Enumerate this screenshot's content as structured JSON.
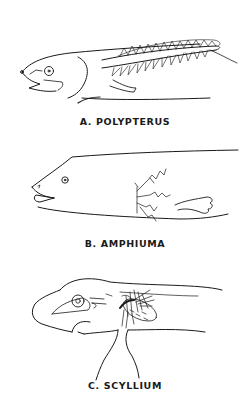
{
  "figure": {
    "panels": [
      {
        "id": "A",
        "caption": "A. POLYPTERUS"
      },
      {
        "id": "B",
        "caption": "B. AMPHIUMA"
      },
      {
        "id": "C",
        "caption": "C. SCYLLIUM"
      }
    ],
    "ink_color": "#1a1a1a",
    "background_color": "#ffffff"
  }
}
